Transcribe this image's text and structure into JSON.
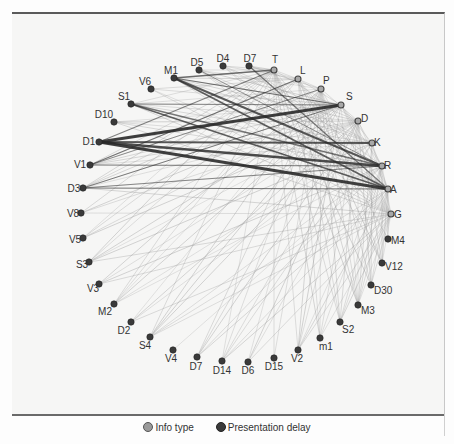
{
  "legend": {
    "items": [
      {
        "label": "Info type",
        "color": "#9a9a9a"
      },
      {
        "label": "Presentation delay",
        "color": "#3a3a3a"
      }
    ]
  },
  "colors": {
    "info_node": "#a8a8a8",
    "delay_node": "#3a3a3a",
    "edge_light": "#9a9a9a",
    "edge_dark": "#2a2a2a"
  },
  "nodes": [
    {
      "id": "T",
      "type": "info",
      "x": 274,
      "y": 70,
      "lx": 272,
      "ly": 63,
      "anchor": "start"
    },
    {
      "id": "L",
      "type": "info",
      "x": 298,
      "y": 79,
      "lx": 300,
      "ly": 74,
      "anchor": "start"
    },
    {
      "id": "P",
      "type": "info",
      "x": 321,
      "y": 89,
      "lx": 323,
      "ly": 84,
      "anchor": "start"
    },
    {
      "id": "S",
      "type": "info",
      "x": 341,
      "y": 105,
      "lx": 346,
      "ly": 100,
      "anchor": "start"
    },
    {
      "id": "D",
      "type": "info",
      "x": 358,
      "y": 121,
      "lx": 361,
      "ly": 122,
      "anchor": "start"
    },
    {
      "id": "K",
      "type": "info",
      "x": 372,
      "y": 143,
      "lx": 374,
      "ly": 146,
      "anchor": "start"
    },
    {
      "id": "R",
      "type": "info",
      "x": 382,
      "y": 166,
      "lx": 384,
      "ly": 169,
      "anchor": "start"
    },
    {
      "id": "A",
      "type": "info",
      "x": 388,
      "y": 189,
      "lx": 390,
      "ly": 193,
      "anchor": "start"
    },
    {
      "id": "G",
      "type": "info",
      "x": 391,
      "y": 214,
      "lx": 394,
      "ly": 218,
      "anchor": "start"
    },
    {
      "id": "M4",
      "type": "delay",
      "x": 388,
      "y": 239,
      "lx": 391,
      "ly": 244,
      "anchor": "start"
    },
    {
      "id": "V12",
      "type": "delay",
      "x": 382,
      "y": 263,
      "lx": 385,
      "ly": 270,
      "anchor": "start"
    },
    {
      "id": "D30",
      "type": "delay",
      "x": 371,
      "y": 285,
      "lx": 374,
      "ly": 294,
      "anchor": "start"
    },
    {
      "id": "M3",
      "type": "delay",
      "x": 358,
      "y": 305,
      "lx": 361,
      "ly": 314,
      "anchor": "start"
    },
    {
      "id": "S2",
      "type": "delay",
      "x": 340,
      "y": 322,
      "lx": 342,
      "ly": 333,
      "anchor": "start"
    },
    {
      "id": "m1",
      "type": "delay",
      "x": 320,
      "y": 338,
      "lx": 319,
      "ly": 350,
      "anchor": "start"
    },
    {
      "id": "V2",
      "type": "delay",
      "x": 298,
      "y": 350,
      "lx": 297,
      "ly": 362,
      "anchor": "middle"
    },
    {
      "id": "D15",
      "type": "delay",
      "x": 274,
      "y": 358,
      "lx": 274,
      "ly": 370,
      "anchor": "middle"
    },
    {
      "id": "D6",
      "type": "delay",
      "x": 248,
      "y": 362,
      "lx": 248,
      "ly": 374,
      "anchor": "middle"
    },
    {
      "id": "D14",
      "type": "delay",
      "x": 222,
      "y": 361,
      "lx": 222,
      "ly": 374,
      "anchor": "middle"
    },
    {
      "id": "D7",
      "type": "delay",
      "x": 197,
      "y": 357,
      "lx": 196,
      "ly": 370,
      "anchor": "middle"
    },
    {
      "id": "V4",
      "type": "delay",
      "x": 173,
      "y": 350,
      "lx": 171,
      "ly": 362,
      "anchor": "middle"
    },
    {
      "id": "S4",
      "type": "delay",
      "x": 150,
      "y": 337,
      "lx": 145,
      "ly": 349,
      "anchor": "middle"
    },
    {
      "id": "D2",
      "type": "delay",
      "x": 131,
      "y": 322,
      "lx": 124,
      "ly": 334,
      "anchor": "middle"
    },
    {
      "id": "M2",
      "type": "delay",
      "x": 114,
      "y": 304,
      "lx": 105,
      "ly": 315,
      "anchor": "middle"
    },
    {
      "id": "V3",
      "type": "delay",
      "x": 99,
      "y": 284,
      "lx": 93,
      "ly": 292,
      "anchor": "middle"
    },
    {
      "id": "S3",
      "type": "delay",
      "x": 89,
      "y": 262,
      "lx": 82,
      "ly": 268,
      "anchor": "middle"
    },
    {
      "id": "V5",
      "type": "delay",
      "x": 83,
      "y": 238,
      "lx": 75,
      "ly": 243,
      "anchor": "middle"
    },
    {
      "id": "V8",
      "type": "delay",
      "x": 81,
      "y": 213,
      "lx": 73,
      "ly": 217,
      "anchor": "middle"
    },
    {
      "id": "D3",
      "type": "delay",
      "x": 83,
      "y": 188,
      "lx": 74,
      "ly": 192,
      "anchor": "middle"
    },
    {
      "id": "V1",
      "type": "delay",
      "x": 90,
      "y": 165,
      "lx": 80,
      "ly": 168,
      "anchor": "middle"
    },
    {
      "id": "D1",
      "type": "delay",
      "x": 99,
      "y": 142,
      "lx": 89,
      "ly": 145,
      "anchor": "middle"
    },
    {
      "id": "D10",
      "type": "delay",
      "x": 114,
      "y": 122,
      "lx": 104,
      "ly": 118,
      "anchor": "middle"
    },
    {
      "id": "S1",
      "type": "delay",
      "x": 131,
      "y": 104,
      "lx": 124,
      "ly": 100,
      "anchor": "middle"
    },
    {
      "id": "V6",
      "type": "delay",
      "x": 151,
      "y": 89,
      "lx": 145,
      "ly": 85,
      "anchor": "middle"
    },
    {
      "id": "M1",
      "type": "delay",
      "x": 174,
      "y": 78,
      "lx": 171,
      "ly": 74,
      "anchor": "middle"
    },
    {
      "id": "D5",
      "type": "delay",
      "x": 199,
      "y": 70,
      "lx": 197,
      "ly": 66,
      "anchor": "middle"
    },
    {
      "id": "D4",
      "type": "delay",
      "x": 223,
      "y": 66,
      "lx": 223,
      "ly": 62,
      "anchor": "middle"
    },
    {
      "id": "D7b",
      "label": "D7",
      "type": "delay",
      "x": 249,
      "y": 66,
      "lx": 250,
      "ly": 62,
      "anchor": "middle"
    }
  ],
  "strong_edges": [
    [
      "D1",
      "S",
      3
    ],
    [
      "D1",
      "A",
      3
    ],
    [
      "D1",
      "R",
      2.4
    ],
    [
      "D1",
      "K",
      2
    ],
    [
      "M1",
      "R",
      2
    ],
    [
      "M1",
      "A",
      1.8
    ],
    [
      "S1",
      "A",
      1.8
    ],
    [
      "S1",
      "R",
      1.4
    ],
    [
      "M1",
      "T",
      1.4
    ],
    [
      "M1",
      "S",
      1.2
    ],
    [
      "D7b",
      "A",
      1.2
    ],
    [
      "V1",
      "L",
      1.2
    ],
    [
      "D3",
      "A",
      1.1
    ],
    [
      "D3",
      "S",
      1
    ],
    [
      "V1",
      "R",
      1
    ],
    [
      "D1",
      "T",
      1.1
    ],
    [
      "D3",
      "R",
      0.9
    ],
    [
      "S1",
      "S",
      0.9
    ],
    [
      "D5",
      "R",
      0.9
    ],
    [
      "V1",
      "P",
      0.9
    ]
  ],
  "light_sources": [
    "T",
    "L",
    "P",
    "S",
    "D",
    "K",
    "R",
    "A",
    "G"
  ],
  "light_targets": [
    "M1",
    "D5",
    "D4",
    "D7b",
    "V6",
    "S1",
    "D10",
    "D1",
    "V1",
    "D3",
    "V8",
    "V5",
    "S3",
    "V3",
    "M2",
    "D2",
    "S4",
    "V4",
    "D7",
    "D14",
    "D6",
    "D15",
    "V2",
    "m1",
    "S2",
    "M3",
    "D30",
    "V12",
    "M4"
  ]
}
